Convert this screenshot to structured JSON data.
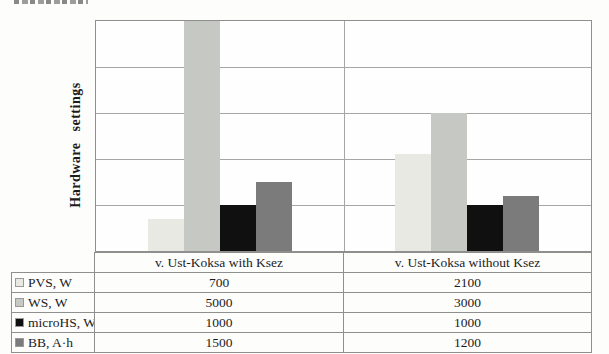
{
  "chart_data": {
    "type": "bar",
    "title": "",
    "xlabel": "",
    "ylabel": "Hardware settings",
    "categories": [
      "v. Ust-Koksa with Ksez",
      "v. Ust-Koksa without Ksez"
    ],
    "series": [
      {
        "name": "PVS, W",
        "values": [
          700,
          2100
        ],
        "color": "#e9e9e3"
      },
      {
        "name": "WS, W",
        "values": [
          5000,
          3000
        ],
        "color": "#c6c9c3"
      },
      {
        "name": "microHS, W",
        "values": [
          1000,
          1000
        ],
        "color": "#101010"
      },
      {
        "name": "BB, A·h",
        "values": [
          1500,
          1200
        ],
        "color": "#7b7b7b"
      }
    ],
    "ylim": [
      0,
      5000
    ],
    "gridline_step": 1000,
    "grid": true,
    "axis_tick_labels_shown": false,
    "legend_position": "data-table-left-column",
    "colors": {
      "plot_border": "#8f8f8f",
      "gridline": "#a6a6a6",
      "table_border": "#8f8f8f",
      "text": "#1c1c1c"
    }
  }
}
